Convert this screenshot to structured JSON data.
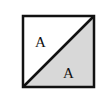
{
  "diagram": {
    "square": {
      "x": 23,
      "y": 16,
      "size": 71,
      "stroke": "#111111",
      "stroke_width": 2.5
    },
    "upper_region": {
      "fill": "#ffffff",
      "label": "A",
      "label_x": 41,
      "label_y": 47
    },
    "lower_region": {
      "fill": "#d8d8d8",
      "label": "A",
      "label_x": 69,
      "label_y": 78
    },
    "diagonal": {
      "from": [
        23,
        87
      ],
      "to": [
        94,
        16
      ]
    }
  }
}
